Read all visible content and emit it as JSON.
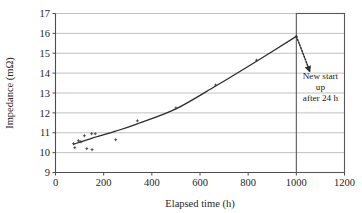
{
  "chart_data": {
    "type": "scatter",
    "title": "",
    "xlabel": "Elapsed time (h)",
    "ylabel": "Impedance (mΩ)",
    "xlim": [
      0,
      1200
    ],
    "ylim": [
      9,
      17
    ],
    "xticks": [
      0,
      200,
      400,
      600,
      800,
      1000,
      1200
    ],
    "yticks": [
      9,
      10,
      11,
      12,
      13,
      14,
      15,
      16,
      17
    ],
    "xtick_labels": [
      "0",
      "200",
      "400",
      "600",
      "800",
      "1000",
      "1200"
    ],
    "ytick_labels": [
      "9",
      "10",
      "11",
      "12",
      "13",
      "14",
      "15",
      "16",
      "17"
    ],
    "grid": "horizontal",
    "legend": "none",
    "series": [
      {
        "name": "Impedance measurements",
        "type": "scatter",
        "marker": "dot",
        "points": [
          {
            "x": 75,
            "y": 10.45
          },
          {
            "x": 80,
            "y": 10.25
          },
          {
            "x": 95,
            "y": 10.6
          },
          {
            "x": 105,
            "y": 10.55
          },
          {
            "x": 120,
            "y": 10.85
          },
          {
            "x": 130,
            "y": 10.2
          },
          {
            "x": 150,
            "y": 10.95
          },
          {
            "x": 152,
            "y": 10.15
          },
          {
            "x": 165,
            "y": 10.95
          },
          {
            "x": 250,
            "y": 10.65
          },
          {
            "x": 340,
            "y": 11.6
          },
          {
            "x": 500,
            "y": 12.25
          },
          {
            "x": 665,
            "y": 13.4
          },
          {
            "x": 835,
            "y": 14.65
          },
          {
            "x": 1000,
            "y": 15.85
          }
        ]
      },
      {
        "name": "Fitted trend",
        "type": "line",
        "points": [
          {
            "x": 75,
            "y": 10.42
          },
          {
            "x": 150,
            "y": 10.72
          },
          {
            "x": 250,
            "y": 11.08
          },
          {
            "x": 340,
            "y": 11.45
          },
          {
            "x": 500,
            "y": 12.2
          },
          {
            "x": 665,
            "y": 13.35
          },
          {
            "x": 835,
            "y": 14.6
          },
          {
            "x": 1000,
            "y": 15.85
          }
        ]
      }
    ],
    "annotations": [
      {
        "name": "restart-region",
        "kind": "box",
        "x_start": 1000,
        "x_end": 1200,
        "y_start": 9,
        "y_end": 17
      },
      {
        "name": "restart-arrow",
        "kind": "arrow",
        "style": "dotted",
        "from": {
          "x": 1000,
          "y": 15.85
        },
        "to": {
          "x": 1055,
          "y": 14.1
        }
      }
    ]
  },
  "annotation": {
    "line1": "New start",
    "line2": "up",
    "line3": "after 24 h"
  },
  "colors": {
    "grid": "#b0b0b0",
    "axis": "#4d4d4d",
    "curve": "#2b2b2b",
    "marker": "#3a3a3a",
    "box": "#595959",
    "arrow": "#2b2b2b",
    "text": "#1a1a1a",
    "background": "#ffffff"
  }
}
